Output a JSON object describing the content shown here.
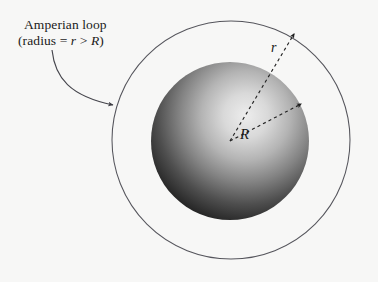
{
  "figure": {
    "title_annotation": {
      "line1": "Amperian loop",
      "line2_prefix": "(radius = ",
      "line2_var1": "r",
      "line2_op": " > ",
      "line2_var2": "R",
      "line2_suffix": ")"
    },
    "labels": {
      "outer_radius": "r",
      "sphere_radius": "R"
    },
    "colors": {
      "background": "#f7f7f6",
      "line": "#4a4a50",
      "dashed": "#2a2a2a",
      "sphere_light": "#e9e9e9",
      "sphere_dark": "#141414",
      "text": "#1a1a1a"
    },
    "geometry": {
      "outer_circle": {
        "cx": 231,
        "cy": 140,
        "r": 119
      },
      "sphere": {
        "cx": 230,
        "cy": 141,
        "r": 79
      },
      "highlight": {
        "cx": 248,
        "cy": 116
      },
      "r_arrow": {
        "from_x": 230,
        "from_y": 141,
        "to_x": 295,
        "to_y": 33
      },
      "R_arrow": {
        "from_x": 230,
        "from_y": 141,
        "to_x": 301,
        "to_y": 104
      },
      "leader": {
        "from_x": 52,
        "from_y": 50,
        "to_x": 114,
        "to_y": 106
      }
    }
  }
}
